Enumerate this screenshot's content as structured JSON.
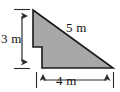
{
  "figure": {
    "kind": "geometry-diagram",
    "fill_color": "#a8a8a8",
    "outline_color": "#1a1a1a",
    "background_color": "#ffffff",
    "label_color": "#111111",
    "unit": "m",
    "labels": {
      "height": "3 m",
      "hypotenuse": "5 m",
      "base": "4 m"
    },
    "measurements": [
      {
        "name": "height",
        "value": 3,
        "unit": "m",
        "text": "3 m",
        "side": "vertical-left"
      },
      {
        "name": "hypotenuse",
        "value": 5,
        "unit": "m",
        "text": "5 m",
        "side": "diagonal"
      },
      {
        "name": "base",
        "value": 4,
        "unit": "m",
        "text": "4 m",
        "side": "horizontal-bottom"
      }
    ],
    "shape_points": "33,10 113,68 42,68 42,47 33,47",
    "dimension_arrows": {
      "height_arrow": {
        "orientation": "vertical",
        "x": 22,
        "y_top": 11,
        "y_bottom": 67
      },
      "base_arrow": {
        "orientation": "horizontal",
        "y": 80,
        "x_left": 37,
        "x_right": 113
      }
    }
  }
}
